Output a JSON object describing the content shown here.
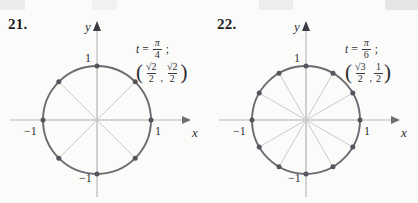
{
  "page": {
    "background_color": "#fbfbfa",
    "ink_color": "#2e2e33",
    "circle_stroke_color": "#6b6b72",
    "spoke_color": "#c9c9ce",
    "axis_color": "#b9b9bf",
    "marker_color": "#55555d"
  },
  "exercises": [
    {
      "number": "21.",
      "figure": {
        "type": "unit-circle",
        "axis_labels": {
          "x": "x",
          "y": "y"
        },
        "ticks": {
          "x_positive": "1",
          "x_negative": "−1",
          "y_positive": "1",
          "y_negative": "−1"
        },
        "divisions": 8,
        "step_degrees": 45,
        "spokes": 4,
        "marked_points": 8,
        "point_angles_degrees": [
          0,
          45,
          90,
          135,
          180,
          225,
          270,
          315
        ],
        "annotation": {
          "t_symbol": "t",
          "equals": "=",
          "t_value_numerator": "π",
          "t_value_denominator": "4",
          "semicolon": ";",
          "coordinate_x_numerator": "√2",
          "coordinate_x_denominator": "2",
          "coordinate_y_numerator": "√2",
          "coordinate_y_denominator": "2",
          "separator": ","
        }
      }
    },
    {
      "number": "22.",
      "figure": {
        "type": "unit-circle",
        "axis_labels": {
          "x": "x",
          "y": "y"
        },
        "ticks": {
          "x_positive": "1",
          "x_negative": "−1",
          "y_positive": "1",
          "y_negative": "−1"
        },
        "divisions": 12,
        "step_degrees": 30,
        "spokes": 6,
        "marked_points": 12,
        "point_angles_degrees": [
          0,
          30,
          60,
          90,
          120,
          150,
          180,
          210,
          240,
          270,
          300,
          330
        ],
        "annotation": {
          "t_symbol": "t",
          "equals": "=",
          "t_value_numerator": "π",
          "t_value_denominator": "6",
          "semicolon": ";",
          "coordinate_x_numerator": "√3",
          "coordinate_x_denominator": "2",
          "coordinate_y_numerator": "1",
          "coordinate_y_denominator": "2",
          "separator": ","
        }
      }
    }
  ]
}
